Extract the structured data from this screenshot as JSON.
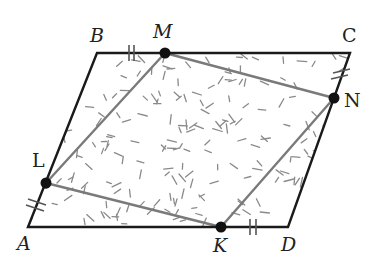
{
  "diagram": {
    "type": "parallelogram-with-inscribed-quadrilateral",
    "colors": {
      "outer_stroke": "#1a1a1a",
      "inner_stroke": "#7a7a7a",
      "point_fill": "#111111",
      "hatch": "#8a8a8a",
      "label": "#222222"
    },
    "vertices": {
      "A": {
        "label": "A",
        "x": 28,
        "y": 227
      },
      "B": {
        "label": "B",
        "x": 97,
        "y": 53
      },
      "C": {
        "label": "C",
        "x": 350,
        "y": 53
      },
      "D": {
        "label": "D",
        "x": 288,
        "y": 227
      }
    },
    "points": {
      "M": {
        "label": "M",
        "x": 165,
        "y": 53
      },
      "N": {
        "label": "N",
        "x": 334,
        "y": 98
      },
      "K": {
        "label": "K",
        "x": 221,
        "y": 227
      },
      "L": {
        "label": "L",
        "x": 46,
        "y": 183
      }
    },
    "equal_marks": [
      {
        "segment": "BM",
        "ticks": 2
      },
      {
        "segment": "CN",
        "ticks": 2
      },
      {
        "segment": "KD",
        "ticks": 2
      },
      {
        "segment": "AL",
        "ticks": 2
      }
    ]
  }
}
